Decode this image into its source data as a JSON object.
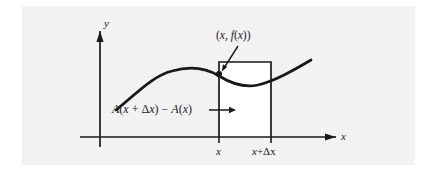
{
  "figure": {
    "kind": "calculus-area-accumulation-diagram",
    "background_color": "#f2f2f2",
    "ink_color": "#1a1a1a",
    "axes": {
      "y_axis_label": "y",
      "x_axis_label": "x",
      "origin": {
        "x": 100,
        "y": 137
      }
    },
    "curve": {
      "description": "smooth curve rising to a maximum then dipping and rising again",
      "stroke_width": 2.6
    },
    "rectangle": {
      "left_x": 219,
      "right_x": 271,
      "top_y": 62,
      "bottom_y": 137,
      "fill": "#ffffff"
    },
    "point_label": {
      "open_paren": "(",
      "x_sym": "x",
      "comma": ", ",
      "f_sym": "f",
      "inner_open": "(",
      "inner_x": "x",
      "inner_close": ")",
      "close_paren": ")",
      "full_text": "(x, f(x))"
    },
    "area_label": {
      "a1": "A",
      "lp1": "(",
      "x1": "x",
      "plus": " + ",
      "delta": "Δ",
      "x2": "x",
      "rp1": ")",
      "minus": " − ",
      "a2": "A",
      "lp2": "(",
      "x3": "x",
      "rp2": ")",
      "full_text": "A(x + Δx) − A(x)"
    },
    "ticks": [
      {
        "label_x": "x",
        "label_delta": "",
        "label_full": "x",
        "at": 222
      },
      {
        "label_x": "x",
        "label_delta": "+Δx",
        "label_full": "x+Δx",
        "at": 269
      }
    ]
  }
}
